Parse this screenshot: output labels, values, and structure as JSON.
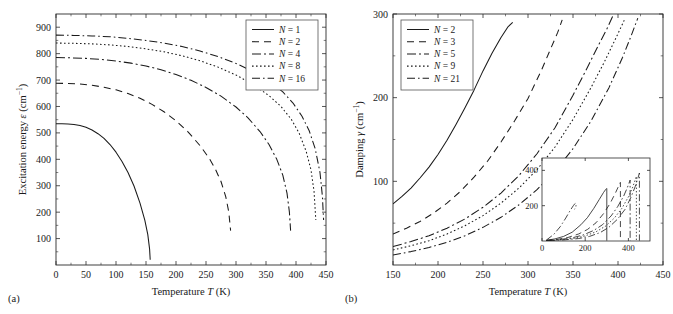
{
  "figure": {
    "panel_a_label": "(a)",
    "panel_b_label": "(b)"
  },
  "chart_data": [
    {
      "id": "panel-a",
      "type": "line",
      "title": "",
      "xlabel": "Temperature T (K)",
      "ylabel": "Excitation energy ε (cm⁻¹)",
      "xlabel_parts": {
        "pre": "Temperature ",
        "ital": "T",
        "post": " (K)"
      },
      "ylabel_parts": {
        "pre": "Excitation energy ",
        "ital": "ε",
        "post": " (cm",
        "sup": "−1",
        "tail": ")"
      },
      "xlim": [
        0,
        450
      ],
      "ylim": [
        0,
        950
      ],
      "xticks": [
        0,
        50,
        100,
        150,
        200,
        250,
        300,
        350,
        400,
        450
      ],
      "yticks": [
        100,
        200,
        300,
        400,
        500,
        600,
        700,
        800,
        900
      ],
      "grid": false,
      "legend_position": "top-right",
      "series": [
        {
          "name": "N = 1",
          "label_pre": "N",
          "label_post": " = 1",
          "dash": "none",
          "x": [
            0,
            10,
            20,
            30,
            40,
            50,
            60,
            70,
            80,
            90,
            100,
            110,
            120,
            130,
            140,
            148,
            153,
            156,
            157
          ],
          "y": [
            535,
            535,
            534,
            532,
            528,
            521,
            511,
            497,
            479,
            456,
            427,
            392,
            350,
            299,
            234,
            170,
            115,
            60,
            20
          ]
        },
        {
          "name": "N = 2",
          "label_pre": "N",
          "label_post": " = 2",
          "dash": "7,5",
          "x": [
            0,
            20,
            40,
            60,
            80,
            100,
            120,
            140,
            160,
            180,
            200,
            220,
            240,
            255,
            265,
            275,
            283,
            288,
            291
          ],
          "y": [
            688,
            687,
            685,
            680,
            673,
            663,
            649,
            631,
            608,
            580,
            546,
            504,
            452,
            405,
            366,
            316,
            258,
            200,
            130
          ]
        },
        {
          "name": "N = 4",
          "label_pre": "N",
          "label_post": " = 4",
          "dash": "9,3,2,3",
          "x": [
            0,
            25,
            50,
            75,
            100,
            125,
            150,
            175,
            200,
            225,
            250,
            275,
            300,
            320,
            340,
            355,
            368,
            378,
            385,
            389,
            391
          ],
          "y": [
            785,
            784,
            782,
            778,
            772,
            764,
            753,
            739,
            721,
            699,
            672,
            639,
            598,
            557,
            505,
            456,
            400,
            340,
            272,
            200,
            130
          ]
        },
        {
          "name": "N = 8",
          "label_pre": "N",
          "label_post": " = 8",
          "dash": "1.6,2.4",
          "x": [
            0,
            30,
            60,
            90,
            120,
            150,
            180,
            210,
            240,
            270,
            300,
            330,
            355,
            375,
            392,
            405,
            417,
            425,
            430,
            433
          ],
          "y": [
            840,
            839,
            837,
            833,
            827,
            818,
            807,
            792,
            773,
            749,
            719,
            681,
            641,
            600,
            552,
            500,
            430,
            360,
            280,
            170
          ]
        },
        {
          "name": "N = 16",
          "label_pre": "N",
          "label_post": " = 16",
          "dash": "8,3,1.6,3",
          "x": [
            0,
            30,
            60,
            90,
            120,
            150,
            180,
            210,
            240,
            270,
            300,
            330,
            355,
            378,
            395,
            410,
            422,
            432,
            440,
            444,
            446
          ],
          "y": [
            870,
            869,
            867,
            864,
            858,
            850,
            840,
            827,
            810,
            789,
            763,
            731,
            698,
            655,
            613,
            563,
            508,
            440,
            350,
            260,
            170
          ]
        }
      ]
    },
    {
      "id": "panel-b",
      "type": "line",
      "title": "",
      "xlabel": "Temperature T (K)",
      "ylabel": "Damping γ (cm⁻¹)",
      "xlabel_parts": {
        "pre": "Temperature ",
        "ital": "T",
        "post": " (K)"
      },
      "ylabel_parts": {
        "pre": "Damping ",
        "ital": "γ",
        "post": " (cm",
        "sup": "−1",
        "tail": ")"
      },
      "xlim": [
        150,
        450
      ],
      "ylim": [
        0,
        300
      ],
      "xticks": [
        150,
        200,
        250,
        300,
        350,
        400,
        450
      ],
      "yticks": [
        100,
        200,
        300
      ],
      "grid": false,
      "legend_position": "top-left",
      "series": [
        {
          "name": "N = 2",
          "label_pre": "N",
          "label_post": " = 2",
          "dash": "none",
          "x": [
            150,
            160,
            170,
            180,
            190,
            200,
            210,
            220,
            230,
            240,
            250,
            260,
            270,
            278,
            283
          ],
          "y": [
            73,
            82,
            92,
            104,
            117,
            132,
            149,
            168,
            188,
            209,
            232,
            253,
            272,
            285,
            290
          ]
        },
        {
          "name": "N = 3",
          "label_pre": "N",
          "label_post": " = 3",
          "dash": "7,5",
          "x": [
            150,
            165,
            180,
            195,
            210,
            225,
            240,
            255,
            270,
            285,
            300,
            315,
            325,
            333,
            338
          ],
          "y": [
            37,
            44,
            52,
            62,
            74,
            88,
            105,
            124,
            147,
            172,
            199,
            233,
            258,
            278,
            293
          ]
        },
        {
          "name": "N = 5",
          "label_pre": "N",
          "label_post": " = 5",
          "dash": "9,3,2,3",
          "x": [
            150,
            170,
            190,
            210,
            230,
            250,
            270,
            290,
            310,
            330,
            350,
            365,
            378,
            388,
            394
          ],
          "y": [
            22,
            28,
            35,
            44,
            55,
            69,
            86,
            107,
            133,
            164,
            203,
            234,
            262,
            283,
            297
          ]
        },
        {
          "name": "N = 9",
          "label_pre": "N",
          "label_post": " = 9",
          "dash": "1.6,2.4",
          "x": [
            150,
            170,
            190,
            210,
            230,
            250,
            270,
            290,
            310,
            330,
            350,
            370,
            385,
            398,
            408
          ],
          "y": [
            18,
            23,
            29,
            37,
            47,
            59,
            74,
            92,
            114,
            141,
            174,
            212,
            243,
            272,
            295
          ]
        },
        {
          "name": "N = 21",
          "label_pre": "N",
          "label_post": " = 21",
          "dash": "8,3,1.6,3",
          "x": [
            150,
            170,
            190,
            210,
            230,
            250,
            270,
            290,
            310,
            330,
            350,
            370,
            390,
            405,
            415,
            422
          ],
          "y": [
            12,
            16,
            21,
            27,
            35,
            45,
            57,
            72,
            90,
            112,
            139,
            172,
            212,
            248,
            275,
            295
          ]
        }
      ],
      "inset": {
        "xlabel": "",
        "ylabel": "",
        "xlim": [
          0,
          500
        ],
        "ylim": [
          0,
          470
        ],
        "xticks": [
          0,
          200,
          400
        ],
        "yticks": [
          200,
          400
        ],
        "series": [
          {
            "name": "N = 2",
            "dash": "none",
            "x": [
              20,
              60,
              100,
              140,
              180,
              210,
              240,
              265,
              285,
              295,
              299,
              300,
              300
            ],
            "y": [
              4,
              12,
              26,
              50,
              92,
              132,
              185,
              235,
              275,
              292,
              297,
              297,
              2
            ]
          },
          {
            "name": "N = 3",
            "dash": "6,4",
            "x": [
              20,
              70,
              120,
              170,
              210,
              250,
              285,
              315,
              340,
              355,
              362,
              363,
              363
            ],
            "y": [
              3,
              9,
              20,
              40,
              65,
              103,
              155,
              212,
              272,
              312,
              330,
              332,
              2
            ]
          },
          {
            "name": "N = 5",
            "dash": "7,2.5,1.6,2.5",
            "x": [
              20,
              80,
              140,
              190,
              240,
              280,
              320,
              350,
              378,
              395,
              405,
              408,
              408
            ],
            "y": [
              3,
              8,
              18,
              34,
              60,
              92,
              142,
              194,
              254,
              302,
              335,
              345,
              2
            ]
          },
          {
            "name": "N = 9",
            "dash": "1.4,2",
            "x": [
              20,
              90,
              150,
              200,
              250,
              295,
              335,
              370,
              400,
              420,
              432,
              437,
              437
            ],
            "y": [
              2,
              7,
              15,
              29,
              52,
              85,
              130,
              185,
              250,
              305,
              348,
              366,
              2
            ]
          },
          {
            "name": "N = 21",
            "dash": "7,2.5,1.4,2.5",
            "x": [
              20,
              55,
              85,
              110,
              130,
              145,
              152,
              156,
              158,
              157,
              155,
              152,
              150
            ],
            "y": [
              5,
              38,
              82,
              130,
              172,
              200,
              211,
              214,
              208,
              196,
              186,
              181,
              180
            ]
          },
          {
            "name": "N = 21b",
            "dash": "7,2.5,1.4,2.5",
            "x": [
              30,
              100,
              170,
              220,
              270,
              310,
              350,
              385,
              412,
              432,
              445,
              451,
              451
            ],
            "y": [
              2,
              6,
              14,
              26,
              48,
              78,
              124,
              180,
              248,
              310,
              360,
              385,
              2
            ]
          }
        ]
      }
    }
  ],
  "legend_a": {
    "entries": [
      {
        "label_pre": "N",
        "label_post": " = 1",
        "dash": "none"
      },
      {
        "label_pre": "N",
        "label_post": " = 2",
        "dash": "7,5"
      },
      {
        "label_pre": "N",
        "label_post": " = 4",
        "dash": "9,3,2,3"
      },
      {
        "label_pre": "N",
        "label_post": " = 8",
        "dash": "1.6,2.4"
      },
      {
        "label_pre": "N",
        "label_post": " = 16",
        "dash": "8,3,1.6,3"
      }
    ]
  },
  "legend_b": {
    "entries": [
      {
        "label_pre": "N",
        "label_post": " = 2",
        "dash": "none"
      },
      {
        "label_pre": "N",
        "label_post": " = 3",
        "dash": "7,5"
      },
      {
        "label_pre": "N",
        "label_post": " = 5",
        "dash": "9,3,2,3"
      },
      {
        "label_pre": "N",
        "label_post": " = 9",
        "dash": "1.6,2.4"
      },
      {
        "label_pre": "N",
        "label_post": " = 21",
        "dash": "8,3,1.6,3"
      }
    ]
  }
}
